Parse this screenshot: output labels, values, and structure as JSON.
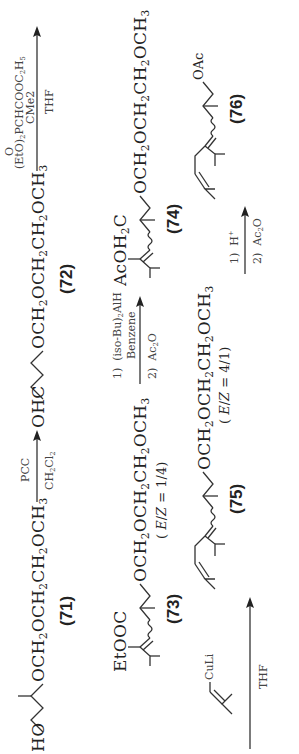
{
  "scheme": {
    "row1": {
      "compound71": {
        "left_group": "HO",
        "chain": "OCH2OCH2CH2OCH3",
        "label": "(71)"
      },
      "arrow1": {
        "above": "PCC",
        "below": "CH2Cl2"
      },
      "compound72": {
        "left_group": "OHC",
        "chain": "OCH2OCH2CH2OCH3",
        "label": "(72)"
      },
      "arrow2": {
        "reagent_oxo": "O",
        "reagent_line1": "(EtO)2PCHCOOC2H5",
        "reagent_line2": "CMe2",
        "below": "THF"
      }
    },
    "row2": {
      "compound73": {
        "top_group": "EtOOC",
        "chain": "OCH2OCH2CH2OCH3",
        "ratio": "(E/Z = 1/4)",
        "label": "(73)"
      },
      "arrow3": {
        "step1": "1)  (iso-Bu)2AlH",
        "step1_solvent": "Benzene",
        "step2": "2)  Ac2O"
      },
      "compound74": {
        "top_group": "AcOH2C",
        "chain": "OCH2OCH2CH2OCH3",
        "label": "(74)"
      }
    },
    "row3": {
      "arrow4": {
        "reagent": "CuLi",
        "below": "THF"
      },
      "compound75": {
        "chain": "OCH2OCH2CH2OCH3",
        "ratio": "(E/Z = 4/1)",
        "label": "(75)"
      },
      "arrow5": {
        "step1": "1)  H+",
        "step2": "2)  Ac2O"
      },
      "compound76": {
        "end_group": "OAc",
        "label": "(76)"
      }
    }
  }
}
